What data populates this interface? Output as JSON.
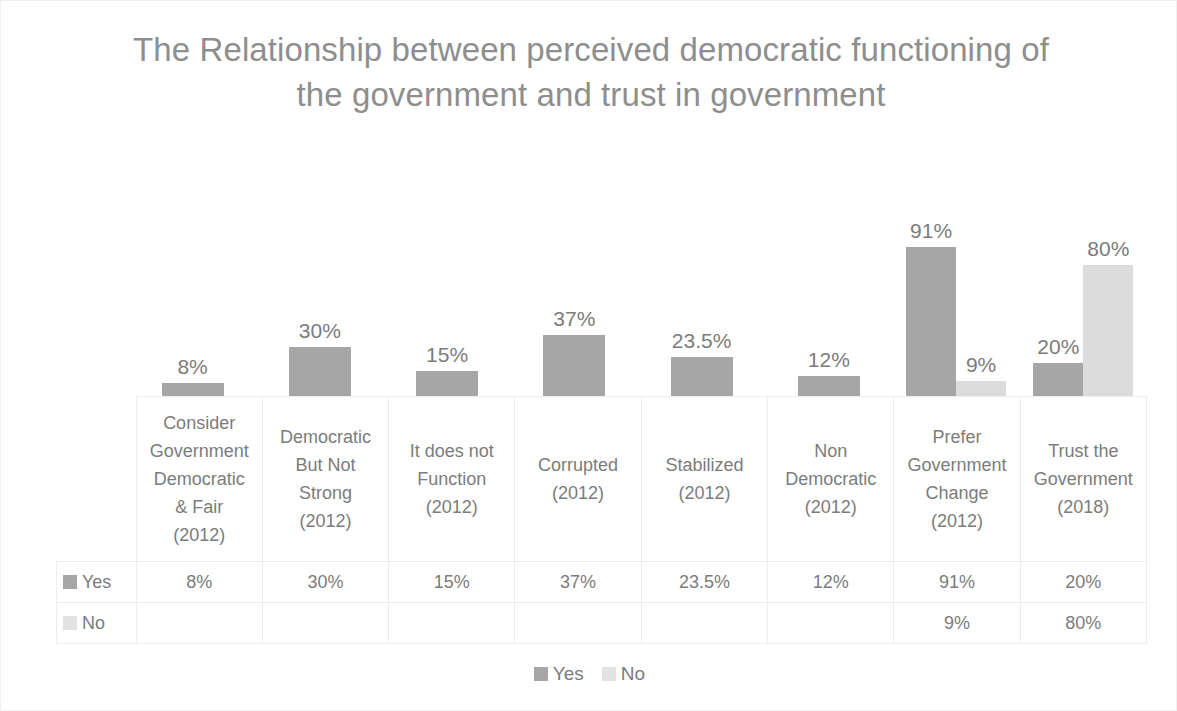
{
  "chart_data": {
    "type": "bar",
    "title": "The Relationship between perceived democratic functioning of the government and trust in government",
    "xlabel": "",
    "ylabel": "",
    "ylim": [
      0,
      100
    ],
    "grid": false,
    "legend_position": "bottom",
    "categories": [
      "Consider Government Democratic & Fair (2012)",
      "Democratic But Not Strong (2012)",
      "It does not Function (2012)",
      "Corrupted (2012)",
      "Stabilized (2012)",
      "Non Democratic (2012)",
      "Prefer Government Change (2012)",
      "Trust the Government (2018)"
    ],
    "series": [
      {
        "name": "Yes",
        "color": "#a6a6a6",
        "values": [
          8,
          30,
          15,
          37,
          23.5,
          12,
          91,
          20
        ],
        "labels": [
          "8%",
          "30%",
          "15%",
          "37%",
          "23.5%",
          "12%",
          "91%",
          "20%"
        ]
      },
      {
        "name": "No",
        "color": "#dcdcdc",
        "values": [
          null,
          null,
          null,
          null,
          null,
          null,
          9,
          80
        ],
        "labels": [
          "",
          "",
          "",
          "",
          "",
          "",
          "9%",
          "80%"
        ]
      }
    ]
  },
  "data_table": {
    "column_headers": [
      [
        "Consider",
        "Government",
        "Democratic",
        "& Fair",
        "(2012)"
      ],
      [
        "Democratic",
        "But Not",
        "Strong",
        "(2012)"
      ],
      [
        "It does not",
        "Function",
        "(2012)"
      ],
      [
        "Corrupted",
        "(2012)"
      ],
      [
        "Stabilized",
        "(2012)"
      ],
      [
        "Non",
        "Democratic",
        "(2012)"
      ],
      [
        "Prefer",
        "Government",
        "Change",
        "(2012)"
      ],
      [
        "Trust the",
        "Government",
        "(2018)"
      ]
    ],
    "rows": [
      {
        "label": "Yes",
        "marker_color": "#a6a6a6",
        "cells": [
          "8%",
          "30%",
          "15%",
          "37%",
          "23.5%",
          "12%",
          "91%",
          "20%"
        ]
      },
      {
        "label": "No",
        "marker_color": "#e2e2e2",
        "cells": [
          "",
          "",
          "",
          "",
          "",
          "",
          "9%",
          "80%"
        ]
      }
    ]
  },
  "legend": {
    "entries": [
      {
        "label": "Yes",
        "color": "#a6a6a6"
      },
      {
        "label": "No",
        "color": "#e2e2e2"
      }
    ]
  }
}
